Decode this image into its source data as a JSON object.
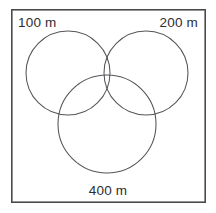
{
  "figure": {
    "type": "three-circle-venn-diagram",
    "frame": {
      "x": 11,
      "y": 9,
      "width": 195,
      "height": 194,
      "stroke_color": "#4b4b4f"
    },
    "circle_stroke_color": "#55555a",
    "background_color": "#ffffff",
    "circles": [
      {
        "name": "circle-100m",
        "cx": 68,
        "cy": 73,
        "r": 42,
        "label": "100 m"
      },
      {
        "name": "circle-200m",
        "cx": 146,
        "cy": 73,
        "r": 42,
        "label": "200 m"
      },
      {
        "name": "circle-400m",
        "cx": 107,
        "cy": 124,
        "r": 49,
        "label": "400 m"
      }
    ],
    "labels": {
      "top_left": "100 m",
      "top_right": "200 m",
      "bottom": "400 m"
    }
  }
}
